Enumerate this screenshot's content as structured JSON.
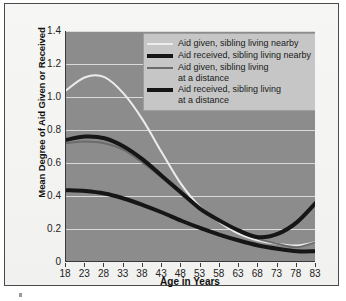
{
  "chart_data": {
    "type": "line",
    "title": "",
    "xlabel": "Age in Years",
    "ylabel": "Mean Degree of Aid Given or Received",
    "xlim": [
      18,
      83
    ],
    "ylim": [
      0,
      1.4
    ],
    "grid": true,
    "legend_position": "top-right inside plot",
    "xticks": [
      "18",
      "23",
      "28",
      "33",
      "38",
      "43",
      "48",
      "53",
      "58",
      "63",
      "68",
      "73",
      "78",
      "83"
    ],
    "yticks": [
      "0",
      "0.2",
      "0.4",
      "0.6",
      "0.8",
      "1.0",
      "1.2",
      "1.4"
    ],
    "x": [
      18,
      23,
      28,
      33,
      38,
      43,
      48,
      53,
      58,
      63,
      68,
      73,
      78,
      83
    ],
    "series": [
      {
        "name": "Aid given, sibling living nearby",
        "color": "#ececec",
        "width": 2,
        "values": [
          1.04,
          1.12,
          1.12,
          1.02,
          0.86,
          0.66,
          0.47,
          0.33,
          0.24,
          0.17,
          0.13,
          0.11,
          0.1,
          0.12
        ]
      },
      {
        "name": "Aid received, sibling living nearby",
        "color": "#161616",
        "width": 4,
        "values": [
          0.74,
          0.76,
          0.75,
          0.7,
          0.62,
          0.52,
          0.42,
          0.32,
          0.25,
          0.19,
          0.15,
          0.17,
          0.24,
          0.36
        ]
      },
      {
        "name": "Aid given, sibling living\nat a distance",
        "color": "#6b6b6b",
        "width": 2,
        "values": [
          0.72,
          0.73,
          0.72,
          0.68,
          0.6,
          0.51,
          0.41,
          0.32,
          0.25,
          0.19,
          0.14,
          0.11,
          0.09,
          0.12
        ]
      },
      {
        "name": "Aid received, sibling living\nat a distance",
        "color": "#161616",
        "width": 4,
        "values": [
          0.435,
          0.43,
          0.415,
          0.385,
          0.345,
          0.3,
          0.25,
          0.205,
          0.165,
          0.13,
          0.1,
          0.08,
          0.065,
          0.065
        ]
      }
    ]
  },
  "legend": {
    "entries": [
      {
        "label": "Aid given, sibling living nearby",
        "color": "#ececec",
        "thick": false
      },
      {
        "label": "Aid received, sibling living nearby",
        "color": "#161616",
        "thick": true
      },
      {
        "label": "Aid given, sibling living\nat a distance",
        "color": "#6b6b6b",
        "thick": false
      },
      {
        "label": "Aid received, sibling living\nat a distance",
        "color": "#161616",
        "thick": true
      }
    ]
  },
  "colors": {
    "plot_background": "#8c8c8c",
    "figure_background": "#f4f4f2",
    "gridline": "#e8e8e8",
    "axis": "#3a3a3a",
    "legend_background": "#c6c6c6",
    "text": "#1a1a1a"
  }
}
